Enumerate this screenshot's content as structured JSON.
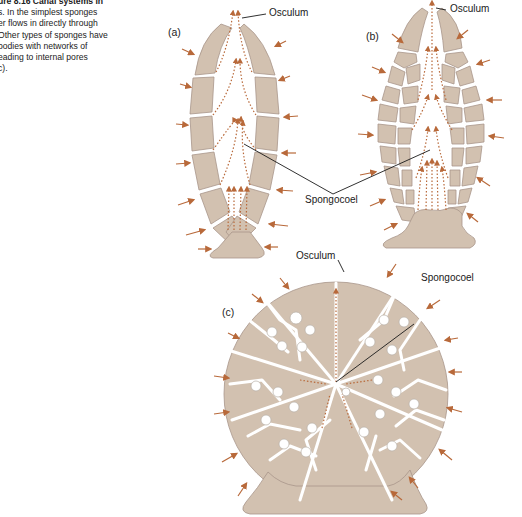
{
  "caption": {
    "lines": [
      "ure 8.16  Canal systems in",
      "s. In the simplest sponges",
      "er flows in directly through",
      "Other types of sponges have",
      "bodies with networks of",
      "eading to internal pores",
      "c)."
    ]
  },
  "panels": {
    "a": {
      "label": "(a)",
      "osculum_label": "Osculum",
      "type": "asconoid"
    },
    "b": {
      "label": "(b)",
      "osculum_label": "Osculum",
      "type": "syconoid"
    },
    "c": {
      "label": "(c)",
      "osculum_label": "Osculum",
      "spongocoel_label": "Spongocoel",
      "type": "leuconoid"
    }
  },
  "shared_labels": {
    "spongocoel_ab": "Spongocoel"
  },
  "colors": {
    "tissue": "#d2c1b0",
    "tissue_edge": "#a8968a",
    "flow_arrow": "#b8693a",
    "leader_line": "#1a1a1a",
    "background": "#ffffff"
  }
}
